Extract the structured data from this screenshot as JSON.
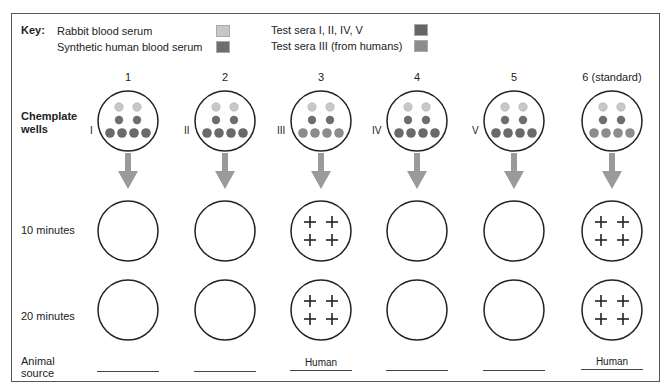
{
  "key": {
    "title": "Key:",
    "items": [
      {
        "label": "Rabbit blood serum",
        "color": "#c8c8c8"
      },
      {
        "label": "Synthetic human blood serum",
        "color": "#6e6e6e"
      },
      {
        "label": "Test sera I, II, IV, V",
        "color": "#666666"
      },
      {
        "label": "Test sera III (from humans)",
        "color": "#8c8c8c"
      }
    ]
  },
  "columns": [
    {
      "number": "1",
      "roman": "I",
      "result_10": "",
      "result_20": "",
      "source": ""
    },
    {
      "number": "2",
      "roman": "II",
      "result_10": "",
      "result_20": "",
      "source": ""
    },
    {
      "number": "3",
      "roman": "III",
      "result_10": "+ +",
      "result_20": "+ +",
      "source": "Human"
    },
    {
      "number": "4",
      "roman": "IV",
      "result_10": "",
      "result_20": "",
      "source": ""
    },
    {
      "number": "5",
      "roman": "V",
      "result_10": "",
      "result_20": "",
      "source": ""
    },
    {
      "number": "6 (standard)",
      "roman": "",
      "result_10": "+ +",
      "result_20": "+ +",
      "source": "Human"
    }
  ],
  "rows": {
    "wells_label_1": "Chemplate",
    "wells_label_2": "wells",
    "ten_min": "10 minutes",
    "twenty_min": "20 minutes",
    "animal_1": "Animal",
    "animal_2": "source"
  },
  "colors": {
    "rabbit": "#c8c8c8",
    "synthetic": "#6e6e6e",
    "test_sera": "#6a6a6a",
    "test_sera_human": "#8c8c8c",
    "arrow": "#9a9a9a"
  }
}
